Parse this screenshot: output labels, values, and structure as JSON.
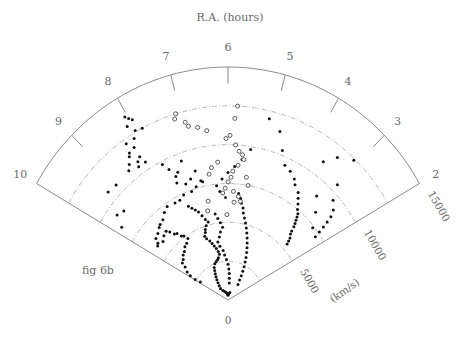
{
  "chart_data": {
    "type": "scatter",
    "subtype": "wedge (polar cone) diagram",
    "title": "R.A. (hours)",
    "annotation": "fig 6b",
    "angular_axis": {
      "label": "R.A. (hours)",
      "range": [
        2,
        10
      ],
      "ticks": [
        2,
        3,
        4,
        5,
        6,
        7,
        8,
        9,
        10
      ],
      "tick_labels": [
        "2",
        "3",
        "4",
        "5",
        "6",
        "7",
        "8",
        "9",
        "10"
      ]
    },
    "radial_axis": {
      "label": "(km/s)",
      "range": [
        0,
        15000
      ],
      "ticks": [
        0,
        5000,
        10000,
        15000
      ],
      "tick_labels": [
        "0",
        "5000",
        "10000",
        "15000"
      ],
      "grid_arcs": [
        2500,
        5000,
        7500,
        10000,
        12500
      ]
    },
    "grid": true,
    "legend": null,
    "series": [
      {
        "name": "filled points",
        "marker": "filled-circle",
        "points": [
          [
            8.05,
            13700
          ],
          [
            8.0,
            13500
          ],
          [
            7.95,
            13300
          ],
          [
            8.1,
            13100
          ],
          [
            8.0,
            12600
          ],
          [
            7.85,
            12500
          ],
          [
            8.1,
            12200
          ],
          [
            8.3,
            12200
          ],
          [
            8.2,
            11700
          ],
          [
            8.35,
            11600
          ],
          [
            8.4,
            11400
          ],
          [
            8.2,
            11000
          ],
          [
            8.3,
            10800
          ],
          [
            8.15,
            10500
          ],
          [
            8.35,
            10500
          ],
          [
            8.5,
            11000
          ],
          [
            8.6,
            10700
          ],
          [
            9.05,
            10600
          ],
          [
            9.3,
            10700
          ],
          [
            9.4,
            9100
          ],
          [
            9.6,
            9300
          ],
          [
            9.8,
            8600
          ],
          [
            7.8,
            9800
          ],
          [
            7.7,
            9300
          ],
          [
            7.6,
            8700
          ],
          [
            7.3,
            9500
          ],
          [
            7.5,
            8900
          ],
          [
            7.65,
            8300
          ],
          [
            7.4,
            8000
          ],
          [
            7.2,
            8200
          ],
          [
            7.0,
            8600
          ],
          [
            6.9,
            7900
          ],
          [
            6.85,
            7800
          ],
          [
            7.1,
            7600
          ],
          [
            7.3,
            7400
          ],
          [
            7.6,
            7400
          ],
          [
            7.8,
            7200
          ],
          [
            8.0,
            7200
          ],
          [
            8.3,
            7300
          ],
          [
            8.5,
            7100
          ],
          [
            8.7,
            6800
          ],
          [
            8.9,
            6700
          ],
          [
            9.0,
            6600
          ],
          [
            9.2,
            6400
          ],
          [
            9.4,
            6300
          ],
          [
            9.5,
            6000
          ],
          [
            9.6,
            5900
          ],
          [
            9.3,
            5800
          ],
          [
            9.1,
            6000
          ],
          [
            8.9,
            6100
          ],
          [
            8.8,
            5900
          ],
          [
            8.7,
            5600
          ],
          [
            8.6,
            5500
          ],
          [
            8.5,
            5200
          ],
          [
            8.4,
            5100
          ],
          [
            8.3,
            4800
          ],
          [
            8.5,
            4600
          ],
          [
            8.7,
            4500
          ],
          [
            8.9,
            4300
          ],
          [
            9.1,
            4200
          ],
          [
            9.3,
            4000
          ],
          [
            9.5,
            3900
          ],
          [
            9.6,
            3600
          ],
          [
            9.8,
            3300
          ],
          [
            9.9,
            3000
          ],
          [
            9.95,
            2600
          ],
          [
            9.9,
            2200
          ],
          [
            7.6,
            6600
          ],
          [
            7.5,
            6400
          ],
          [
            7.4,
            6200
          ],
          [
            7.3,
            6000
          ],
          [
            7.2,
            5700
          ],
          [
            7.1,
            5400
          ],
          [
            7.0,
            5200
          ],
          [
            7.15,
            5000
          ],
          [
            7.25,
            4800
          ],
          [
            7.3,
            4600
          ],
          [
            7.4,
            4400
          ],
          [
            7.35,
            4200
          ],
          [
            7.2,
            4000
          ],
          [
            7.1,
            3800
          ],
          [
            7.0,
            3600
          ],
          [
            6.9,
            3400
          ],
          [
            6.8,
            3200
          ],
          [
            6.75,
            3000
          ],
          [
            6.9,
            2800
          ],
          [
            7.0,
            2700
          ],
          [
            7.2,
            2600
          ],
          [
            7.4,
            2500
          ],
          [
            7.6,
            2300
          ],
          [
            7.7,
            2100
          ],
          [
            7.8,
            1900
          ],
          [
            7.9,
            1700
          ],
          [
            8.0,
            1500
          ],
          [
            8.1,
            1300
          ],
          [
            8.2,
            1100
          ],
          [
            8.3,
            900
          ],
          [
            8.0,
            700
          ],
          [
            7.5,
            600
          ],
          [
            7.0,
            500
          ],
          [
            6.5,
            400
          ],
          [
            6.0,
            300
          ],
          [
            5.5,
            400
          ],
          [
            5.0,
            500
          ],
          [
            6.6,
            5600
          ],
          [
            6.5,
            5300
          ],
          [
            6.4,
            5000
          ],
          [
            6.3,
            4700
          ],
          [
            6.45,
            4400
          ],
          [
            6.55,
            4100
          ],
          [
            6.7,
            3800
          ],
          [
            6.6,
            3500
          ],
          [
            6.4,
            3200
          ],
          [
            6.3,
            2900
          ],
          [
            6.15,
            2600
          ],
          [
            6.0,
            2300
          ],
          [
            5.9,
            2000
          ],
          [
            5.8,
            1700
          ],
          [
            5.75,
            1400
          ],
          [
            5.7,
            1100
          ],
          [
            5.6,
            6900
          ],
          [
            5.5,
            6600
          ],
          [
            5.45,
            6300
          ],
          [
            5.35,
            6000
          ],
          [
            5.3,
            5700
          ],
          [
            5.2,
            5400
          ],
          [
            5.1,
            5100
          ],
          [
            5.0,
            4800
          ],
          [
            4.9,
            4500
          ],
          [
            4.8,
            4200
          ],
          [
            4.7,
            3900
          ],
          [
            4.6,
            3600
          ],
          [
            4.5,
            3300
          ],
          [
            4.4,
            3000
          ],
          [
            4.3,
            2700
          ],
          [
            4.2,
            2400
          ],
          [
            4.1,
            2100
          ],
          [
            4.0,
            1800
          ],
          [
            3.9,
            1500
          ],
          [
            3.7,
            1200
          ],
          [
            4.4,
            9500
          ],
          [
            4.2,
            9300
          ],
          [
            4.0,
            9000
          ],
          [
            3.9,
            8700
          ],
          [
            3.7,
            8400
          ],
          [
            3.6,
            8100
          ],
          [
            3.5,
            7800
          ],
          [
            3.4,
            7500
          ],
          [
            3.3,
            7300
          ],
          [
            3.25,
            7100
          ],
          [
            3.2,
            6900
          ],
          [
            3.15,
            6700
          ],
          [
            3.1,
            6500
          ],
          [
            3.05,
            6200
          ],
          [
            3.0,
            6000
          ],
          [
            2.9,
            5800
          ],
          [
            2.85,
            5600
          ],
          [
            2.8,
            5400
          ],
          [
            3.6,
            11000
          ],
          [
            3.4,
            11800
          ],
          [
            3.1,
            12400
          ],
          [
            3.0,
            10500
          ],
          [
            2.8,
            9600
          ],
          [
            2.6,
            9200
          ],
          [
            2.5,
            8800
          ],
          [
            2.45,
            8400
          ],
          [
            2.4,
            8000
          ],
          [
            2.35,
            7600
          ],
          [
            2.3,
            7200
          ],
          [
            2.6,
            7400
          ],
          [
            2.9,
            8200
          ],
          [
            3.2,
            9000
          ],
          [
            4.6,
            10300
          ],
          [
            4.8,
            11400
          ],
          [
            5.1,
            12000
          ],
          [
            5.4,
            9800
          ],
          [
            5.6,
            9100
          ],
          [
            5.8,
            8600
          ],
          [
            6.0,
            8200
          ],
          [
            6.2,
            7800
          ],
          [
            6.4,
            7400
          ],
          [
            6.3,
            7000
          ],
          [
            6.1,
            6600
          ]
        ]
      },
      {
        "name": "open points",
        "marker": "open-circle",
        "points": [
          [
            7.1,
            12500
          ],
          [
            7.15,
            12200
          ],
          [
            6.95,
            11800
          ],
          [
            6.9,
            11500
          ],
          [
            6.7,
            11300
          ],
          [
            6.5,
            11000
          ],
          [
            5.8,
            12500
          ],
          [
            5.85,
            11700
          ],
          [
            6.05,
            10400
          ],
          [
            5.95,
            10600
          ],
          [
            5.8,
            10000
          ],
          [
            5.7,
            9600
          ],
          [
            5.6,
            9400
          ],
          [
            5.55,
            9100
          ],
          [
            5.7,
            8700
          ],
          [
            5.85,
            8300
          ],
          [
            5.9,
            7900
          ],
          [
            6.0,
            7600
          ],
          [
            6.1,
            7200
          ],
          [
            5.8,
            7000
          ],
          [
            5.6,
            6700
          ],
          [
            5.5,
            6400
          ],
          [
            5.75,
            6300
          ],
          [
            6.2,
            6900
          ],
          [
            6.3,
            8900
          ],
          [
            6.5,
            8600
          ],
          [
            6.6,
            8200
          ],
          [
            5.4,
            8000
          ],
          [
            5.3,
            7500
          ],
          [
            6.8,
            6500
          ],
          [
            6.9,
            5900
          ],
          [
            6.05,
            5500
          ]
        ]
      }
    ]
  },
  "labels": {
    "title": "R.A. (hours)",
    "fig": "fig 6b",
    "radial_unit": "(km/s)",
    "ra_ticks": [
      "2",
      "3",
      "4",
      "5",
      "6",
      "7",
      "8",
      "9",
      "10"
    ],
    "vel_ticks": [
      "0",
      "5000",
      "10000",
      "15000"
    ]
  }
}
